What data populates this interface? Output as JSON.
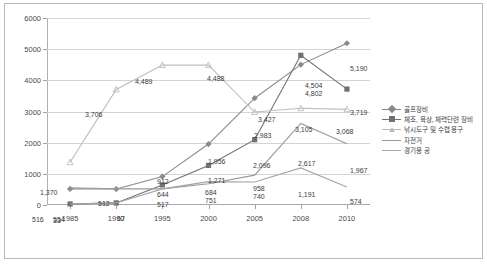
{
  "chart_data": {
    "type": "line",
    "title": "",
    "xlabel": "",
    "ylabel": "",
    "categories": [
      "1985",
      "1990",
      "1995",
      "2000",
      "2005",
      "2008",
      "2010"
    ],
    "ylim": [
      0,
      6000
    ],
    "ytick_labels": [
      "0",
      "1000",
      "2000",
      "3000",
      "4000",
      "5000",
      "6000"
    ],
    "yticks": [
      0,
      1000,
      2000,
      3000,
      4000,
      5000,
      6000
    ],
    "grid": true,
    "legend_position": "right",
    "series": [
      {
        "name": "골프장비",
        "color": "#8a8a8a",
        "marker": "diamond",
        "values": [
          516,
          512,
          912,
          1956,
          3427,
          4504,
          5190
        ],
        "labels": [
          "516",
          "512",
          "912",
          "1,956",
          "3,427",
          "4,504",
          "5,190"
        ]
      },
      {
        "name": "체조, 육상, 체력단련 장비",
        "color": "#707070",
        "marker": "square",
        "values": [
          33,
          67,
          644,
          1271,
          2096,
          4802,
          3719
        ],
        "labels": [
          "33",
          "67",
          "644",
          "1,271",
          "2,096",
          "4,802",
          "3,719"
        ]
      },
      {
        "name": "낚시도구 및 수렵 용구",
        "color": "#bdbdbd",
        "marker": "triangle",
        "values": [
          1370,
          3706,
          4489,
          4488,
          2983,
          3105,
          3068
        ],
        "labels": [
          "1,370",
          "3,706",
          "4,489",
          "4,488",
          "2,983",
          "3,105",
          "3,068"
        ]
      },
      {
        "name": "자전거",
        "color": "#9a9a9a",
        "marker": "none",
        "values": [
          554,
          517,
          517,
          684,
          958,
          2617,
          1967
        ],
        "labels": [
          "554",
          "517",
          "517",
          "684",
          "958",
          "2,617",
          "1,967"
        ]
      },
      {
        "name": "경기용 공",
        "color": "#a6a6a6",
        "marker": "none",
        "values": [
          33,
          67,
          517,
          751,
          740,
          1191,
          574
        ],
        "labels": [
          "33",
          "67",
          "517",
          "751",
          "740",
          "1,191",
          "574"
        ]
      }
    ],
    "point_labels": [
      {
        "text": "1,370",
        "x": 35,
        "y": 188
      },
      {
        "text": "3,706",
        "x": 80,
        "y": 110
      },
      {
        "text": "4,489",
        "x": 130,
        "y": 77
      },
      {
        "text": "4,488",
        "x": 202,
        "y": 74
      },
      {
        "text": "2,983",
        "x": 249,
        "y": 131
      },
      {
        "text": "3,105",
        "x": 290,
        "y": 125
      },
      {
        "text": "3,068",
        "x": 331,
        "y": 127
      },
      {
        "text": "516",
        "x": 27,
        "y": 215
      },
      {
        "text": "512",
        "x": 93,
        "y": 199
      },
      {
        "text": "912",
        "x": 152,
        "y": 177
      },
      {
        "text": "1,956",
        "x": 203,
        "y": 157
      },
      {
        "text": "3,427",
        "x": 253,
        "y": 115
      },
      {
        "text": "4,504",
        "x": 300,
        "y": 81
      },
      {
        "text": "5,190",
        "x": 345,
        "y": 64
      },
      {
        "text": "33",
        "x": 48,
        "y": 216
      },
      {
        "text": "67",
        "x": 112,
        "y": 214
      },
      {
        "text": "644",
        "x": 152,
        "y": 190
      },
      {
        "text": "1,271",
        "x": 203,
        "y": 176
      },
      {
        "text": "2,096",
        "x": 248,
        "y": 161
      },
      {
        "text": "4,802",
        "x": 300,
        "y": 89
      },
      {
        "text": "3,719",
        "x": 345,
        "y": 108
      },
      {
        "text": "554",
        "x": 48,
        "y": 215
      },
      {
        "text": "684",
        "x": 200,
        "y": 188
      },
      {
        "text": "958",
        "x": 248,
        "y": 184
      },
      {
        "text": "2,617",
        "x": 293,
        "y": 159
      },
      {
        "text": "1,967",
        "x": 345,
        "y": 166
      },
      {
        "text": "517",
        "x": 152,
        "y": 200
      },
      {
        "text": "751",
        "x": 200,
        "y": 196
      },
      {
        "text": "740",
        "x": 248,
        "y": 192
      },
      {
        "text": "1,191",
        "x": 293,
        "y": 190
      },
      {
        "text": "574",
        "x": 345,
        "y": 197
      }
    ]
  }
}
